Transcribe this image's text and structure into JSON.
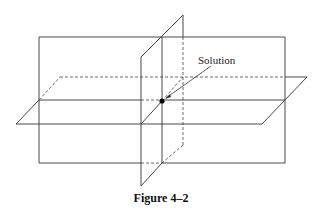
{
  "diagram": {
    "label": "Solution",
    "caption": "Figure 4–2",
    "elements": [
      "vertical-frontal-plane",
      "horizontal-plane",
      "vertical-side-plane",
      "solution-point"
    ]
  }
}
